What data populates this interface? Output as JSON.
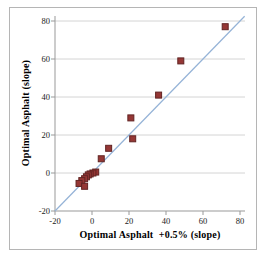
{
  "chart_data": {
    "type": "scatter",
    "title": "",
    "xlabel": "Optimal Asphalt  +0.5% (slope)",
    "ylabel": "Optimal Asphalt (slope)",
    "xlim": [
      -20,
      80
    ],
    "ylim": [
      -20,
      80
    ],
    "x_ticks": [
      -20,
      0,
      20,
      40,
      60,
      80
    ],
    "y_ticks": [
      -20,
      0,
      20,
      40,
      60,
      80
    ],
    "grid": "horizontal-only",
    "legend": "none",
    "series": [
      {
        "name": "optimal-asphalt-points",
        "marker": "square",
        "points": [
          [
            72,
            77
          ],
          [
            48,
            59
          ],
          [
            36,
            41
          ],
          [
            21,
            29
          ],
          [
            22,
            18
          ],
          [
            9,
            13
          ],
          [
            5,
            7.5
          ],
          [
            2,
            0.5
          ],
          [
            0.5,
            0
          ],
          [
            -1,
            -0.5
          ],
          [
            -2,
            -1
          ],
          [
            -3,
            -2
          ],
          [
            -4,
            -3
          ],
          [
            -5.5,
            -4
          ],
          [
            -7,
            -5.5
          ],
          [
            -4,
            -7
          ]
        ]
      }
    ],
    "reference_line": {
      "type": "identity-trendline",
      "from": [
        -20,
        -20
      ],
      "to": [
        82.5,
        82.5
      ]
    }
  },
  "colors": {
    "marker_fill": "#953735",
    "marker_stroke": "#622423",
    "reference_line": "#95b3d7",
    "gridline": "#d4d4d4",
    "axis_line": "#999999",
    "tick_text": "#1a1a1a",
    "frame_border": "#b5b5b5",
    "background": "#ffffff"
  }
}
